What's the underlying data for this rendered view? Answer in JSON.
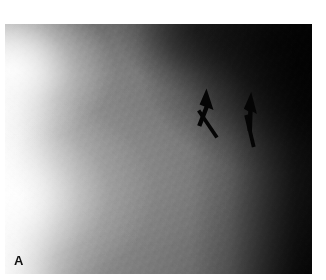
{
  "figure": {
    "kind": "grayscale-radiograph",
    "panel_label": "A",
    "caption_text": "",
    "plate": {
      "left": 5,
      "top": 24,
      "width": 307,
      "height": 250,
      "background_color": "#6d6d6d",
      "margin_color": "#ffffff"
    },
    "tones": {
      "highlight": "#f7f7f7",
      "upper_mid": "#9a9a9a",
      "mid_field": "#6d6d6d",
      "shadow": "#2c2c2c",
      "deep_shadow": "#101010",
      "annotation": "#000000"
    },
    "annotations": [
      {
        "name": "arrow-left",
        "shape": "arrow",
        "color": "#000000",
        "tip_x": 206,
        "tip_y": 89,
        "tail_x": 216,
        "tail_y": 134,
        "points_to": "upper-left"
      },
      {
        "name": "arrow-right",
        "shape": "arrow",
        "color": "#000000",
        "tip_x": 251,
        "tip_y": 95,
        "tail_x": 254,
        "tail_y": 140,
        "points_to": "up"
      }
    ]
  }
}
